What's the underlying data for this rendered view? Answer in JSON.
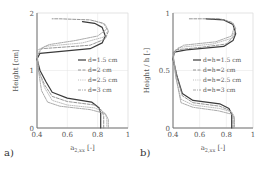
{
  "chart_data": [
    {
      "type": "line",
      "panel_label": "a)",
      "title": "",
      "xlabel": "a_2,xx [-]",
      "xlabel_main": "a",
      "xlabel_sub": "2,xx",
      "xlabel_unit": "[-]",
      "ylabel": "Height [cm]",
      "xlim": [
        0.4,
        1.0
      ],
      "ylim": [
        0,
        2
      ],
      "xticks": [
        "0.4",
        "0.6",
        "0.8",
        "1"
      ],
      "yticks": [
        "0",
        "1",
        "2"
      ],
      "grid": true,
      "legend_position": "center-right",
      "legend": [
        "d=1.5 cm",
        "d=2 cm",
        "d=2.5 cm",
        "d=3 cm"
      ],
      "series": [
        {
          "name": "d=1.5 cm",
          "style": "solid",
          "points": [
            [
              0.82,
              0.0
            ],
            [
              0.82,
              0.25
            ],
            [
              0.81,
              0.35
            ],
            [
              0.76,
              0.45
            ],
            [
              0.6,
              0.52
            ],
            [
              0.5,
              0.62
            ],
            [
              0.46,
              0.8
            ],
            [
              0.42,
              1.0
            ],
            [
              0.4,
              1.2
            ],
            [
              0.42,
              1.3
            ],
            [
              0.75,
              1.38
            ],
            [
              0.83,
              1.48
            ],
            [
              0.85,
              1.6
            ],
            [
              0.83,
              1.75
            ],
            [
              0.78,
              1.82
            ],
            [
              0.7,
              1.85
            ]
          ]
        },
        {
          "name": "d=2 cm",
          "style": "dashed",
          "points": [
            [
              0.84,
              0.0
            ],
            [
              0.84,
              0.2
            ],
            [
              0.83,
              0.3
            ],
            [
              0.78,
              0.4
            ],
            [
              0.6,
              0.46
            ],
            [
              0.5,
              0.55
            ],
            [
              0.45,
              0.75
            ],
            [
              0.41,
              1.0
            ],
            [
              0.4,
              1.25
            ],
            [
              0.43,
              1.38
            ],
            [
              0.75,
              1.44
            ],
            [
              0.85,
              1.55
            ],
            [
              0.87,
              1.68
            ],
            [
              0.84,
              1.82
            ],
            [
              0.75,
              1.88
            ],
            [
              0.55,
              1.9
            ],
            [
              0.5,
              1.9
            ]
          ]
        },
        {
          "name": "d=2.5 cm",
          "style": "dotted",
          "points": [
            [
              0.86,
              0.0
            ],
            [
              0.86,
              0.18
            ],
            [
              0.84,
              0.28
            ],
            [
              0.78,
              0.35
            ],
            [
              0.6,
              0.4
            ],
            [
              0.5,
              0.48
            ],
            [
              0.45,
              0.7
            ],
            [
              0.41,
              1.0
            ],
            [
              0.4,
              1.3
            ],
            [
              0.45,
              1.42
            ],
            [
              0.7,
              1.48
            ],
            [
              0.84,
              1.58
            ],
            [
              0.87,
              1.7
            ],
            [
              0.85,
              1.8
            ],
            [
              0.78,
              1.86
            ]
          ]
        },
        {
          "name": "d=3 cm",
          "style": "dashdot",
          "points": [
            [
              0.87,
              0.0
            ],
            [
              0.87,
              0.15
            ],
            [
              0.85,
              0.25
            ],
            [
              0.75,
              0.32
            ],
            [
              0.55,
              0.38
            ],
            [
              0.47,
              0.45
            ],
            [
              0.43,
              0.65
            ],
            [
              0.41,
              1.0
            ],
            [
              0.4,
              1.35
            ],
            [
              0.48,
              1.45
            ],
            [
              0.65,
              1.52
            ],
            [
              0.8,
              1.6
            ],
            [
              0.86,
              1.72
            ]
          ]
        }
      ]
    },
    {
      "type": "line",
      "panel_label": "b)",
      "title": "",
      "xlabel": "a_2,xx [-]",
      "xlabel_main": "a",
      "xlabel_sub": "2,xx",
      "xlabel_unit": "[-]",
      "ylabel": "Height / h [-]",
      "xlim": [
        0.4,
        1.0
      ],
      "ylim": [
        0,
        1
      ],
      "xticks": [
        "0.4",
        "0.6",
        "0.8",
        "1"
      ],
      "yticks": [
        "0",
        "0.5",
        "1"
      ],
      "grid": true,
      "legend_position": "center-right",
      "legend": [
        "d=h=1.5 cm",
        "d=h=2 cm",
        "d=h=2.5 cm",
        "d=h=3 cm"
      ],
      "series": [
        {
          "name": "d=h=1.5 cm",
          "style": "solid",
          "points": [
            [
              0.84,
              0.0
            ],
            [
              0.84,
              0.12
            ],
            [
              0.82,
              0.17
            ],
            [
              0.75,
              0.21
            ],
            [
              0.55,
              0.24
            ],
            [
              0.47,
              0.3
            ],
            [
              0.43,
              0.45
            ],
            [
              0.4,
              0.6
            ],
            [
              0.41,
              0.66
            ],
            [
              0.5,
              0.68
            ],
            [
              0.78,
              0.71
            ],
            [
              0.85,
              0.76
            ],
            [
              0.87,
              0.82
            ],
            [
              0.85,
              0.9
            ],
            [
              0.78,
              0.94
            ],
            [
              0.65,
              0.95
            ]
          ]
        },
        {
          "name": "d=h=2 cm",
          "style": "dashed",
          "points": [
            [
              0.85,
              0.0
            ],
            [
              0.85,
              0.11
            ],
            [
              0.83,
              0.15
            ],
            [
              0.75,
              0.19
            ],
            [
              0.55,
              0.22
            ],
            [
              0.47,
              0.28
            ],
            [
              0.43,
              0.45
            ],
            [
              0.4,
              0.62
            ],
            [
              0.42,
              0.68
            ],
            [
              0.6,
              0.7
            ],
            [
              0.8,
              0.73
            ],
            [
              0.86,
              0.8
            ],
            [
              0.87,
              0.87
            ],
            [
              0.84,
              0.92
            ],
            [
              0.75,
              0.95
            ],
            [
              0.55,
              0.95
            ],
            [
              0.52,
              0.95
            ]
          ]
        },
        {
          "name": "d=h=2.5 cm",
          "style": "dotted",
          "points": [
            [
              0.86,
              0.0
            ],
            [
              0.86,
              0.1
            ],
            [
              0.84,
              0.14
            ],
            [
              0.75,
              0.17
            ],
            [
              0.55,
              0.2
            ],
            [
              0.46,
              0.25
            ],
            [
              0.42,
              0.45
            ],
            [
              0.4,
              0.64
            ],
            [
              0.44,
              0.7
            ],
            [
              0.7,
              0.73
            ],
            [
              0.84,
              0.78
            ],
            [
              0.87,
              0.86
            ],
            [
              0.85,
              0.92
            ]
          ]
        },
        {
          "name": "d=h=3 cm",
          "style": "dashdot",
          "points": [
            [
              0.86,
              0.0
            ],
            [
              0.86,
              0.09
            ],
            [
              0.84,
              0.12
            ],
            [
              0.74,
              0.15
            ],
            [
              0.55,
              0.18
            ],
            [
              0.46,
              0.22
            ],
            [
              0.42,
              0.45
            ],
            [
              0.4,
              0.66
            ],
            [
              0.48,
              0.72
            ],
            [
              0.72,
              0.75
            ],
            [
              0.84,
              0.8
            ],
            [
              0.86,
              0.88
            ]
          ]
        }
      ]
    }
  ],
  "colors": {
    "axis": "#666666",
    "grid": "#e2e2e2",
    "series": [
      "#3a3a3a",
      "#8a8a8a",
      "#b5b5b5",
      "#a0a0a0"
    ]
  }
}
